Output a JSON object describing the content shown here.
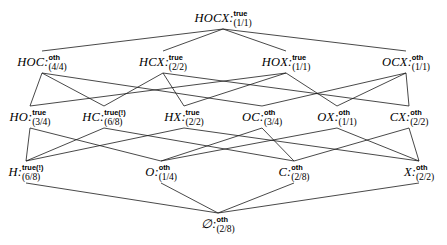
{
  "diagram": {
    "kind": "hasse-lattice",
    "title": "",
    "background": "#ffffff",
    "line_color": "#1a1a1a",
    "text_color": "#000000"
  },
  "nodes": [
    {
      "id": "HOCX",
      "label": "HOCX",
      "sep": ":",
      "status": "true",
      "count": "(1/1)",
      "x": 223,
      "y": 18,
      "level": 0
    },
    {
      "id": "HOC",
      "label": "HOC",
      "sep": ":",
      "status": "oth",
      "count": "(4/4)",
      "x": 42,
      "y": 62,
      "level": 1
    },
    {
      "id": "HCX",
      "label": "HCX",
      "sep": ":",
      "status": "true",
      "count": "(2/2)",
      "x": 163,
      "y": 62,
      "level": 1
    },
    {
      "id": "HOX",
      "label": "HOX",
      "sep": ":",
      "status": "true",
      "count": "(1/1)",
      "x": 286,
      "y": 62,
      "level": 1
    },
    {
      "id": "OCX",
      "label": "OCX",
      "sep": ":",
      "status": "oth",
      "count": "(1/1)",
      "x": 406,
      "y": 62,
      "level": 1
    },
    {
      "id": "HO",
      "label": "HO",
      "sep": ":",
      "status": "true",
      "count": "(3/4)",
      "x": 30,
      "y": 117,
      "level": 2
    },
    {
      "id": "HC",
      "label": "HC",
      "sep": ":",
      "status": "true(!)",
      "count": "(6/8)",
      "x": 104,
      "y": 117,
      "level": 2
    },
    {
      "id": "HX",
      "label": "HX",
      "sep": ":",
      "status": "true",
      "count": "(2/2)",
      "x": 184,
      "y": 117,
      "level": 2
    },
    {
      "id": "OC",
      "label": "OC",
      "sep": ":",
      "status": "oth",
      "count": "(3/4)",
      "x": 262,
      "y": 117,
      "level": 2
    },
    {
      "id": "OX",
      "label": "OX",
      "sep": ":",
      "status": "oth",
      "count": "(1/1)",
      "x": 337,
      "y": 117,
      "level": 2
    },
    {
      "id": "CX",
      "label": "CX",
      "sep": ":",
      "status": "oth",
      "count": "(2/2)",
      "x": 409,
      "y": 117,
      "level": 2
    },
    {
      "id": "H",
      "label": "H",
      "sep": ":",
      "status": "true(!)",
      "count": "(6/8)",
      "x": 26,
      "y": 172,
      "level": 3
    },
    {
      "id": "O",
      "label": "O",
      "sep": ":",
      "status": "oth",
      "count": "(1/4)",
      "x": 161,
      "y": 172,
      "level": 3
    },
    {
      "id": "C",
      "label": "C",
      "sep": ":",
      "status": "oth",
      "count": "(2/8)",
      "x": 294,
      "y": 172,
      "level": 3
    },
    {
      "id": "X",
      "label": "X",
      "sep": ":",
      "status": "oth",
      "count": "(2/2)",
      "x": 419,
      "y": 172,
      "level": 3
    },
    {
      "id": "EMPTY",
      "label": "∅",
      "sep": ":",
      "status": "oth",
      "count": "(2/8)",
      "x": 218,
      "y": 224,
      "level": 4
    }
  ],
  "edges": [
    {
      "from": "HOCX",
      "to": "HOC"
    },
    {
      "from": "HOCX",
      "to": "HCX"
    },
    {
      "from": "HOCX",
      "to": "HOX"
    },
    {
      "from": "HOCX",
      "to": "OCX"
    },
    {
      "from": "HOC",
      "to": "HO"
    },
    {
      "from": "HOC",
      "to": "HC"
    },
    {
      "from": "HOC",
      "to": "OC"
    },
    {
      "from": "HCX",
      "to": "HC"
    },
    {
      "from": "HCX",
      "to": "HX"
    },
    {
      "from": "HCX",
      "to": "CX"
    },
    {
      "from": "HOX",
      "to": "HO"
    },
    {
      "from": "HOX",
      "to": "HX"
    },
    {
      "from": "HOX",
      "to": "OX"
    },
    {
      "from": "OCX",
      "to": "OC"
    },
    {
      "from": "OCX",
      "to": "OX"
    },
    {
      "from": "OCX",
      "to": "CX"
    },
    {
      "from": "HO",
      "to": "H"
    },
    {
      "from": "HO",
      "to": "O"
    },
    {
      "from": "HC",
      "to": "H"
    },
    {
      "from": "HC",
      "to": "C"
    },
    {
      "from": "HX",
      "to": "H"
    },
    {
      "from": "HX",
      "to": "X"
    },
    {
      "from": "OC",
      "to": "O"
    },
    {
      "from": "OC",
      "to": "C"
    },
    {
      "from": "OX",
      "to": "O"
    },
    {
      "from": "OX",
      "to": "X"
    },
    {
      "from": "CX",
      "to": "C"
    },
    {
      "from": "CX",
      "to": "X"
    },
    {
      "from": "H",
      "to": "EMPTY"
    },
    {
      "from": "O",
      "to": "EMPTY"
    },
    {
      "from": "C",
      "to": "EMPTY"
    },
    {
      "from": "X",
      "to": "EMPTY"
    }
  ]
}
